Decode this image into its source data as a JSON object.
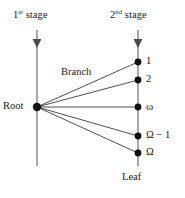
{
  "diagram": {
    "background_color": "#ffffff",
    "axis_color": "#a8a8a8",
    "branch_color": "#3a3a3a",
    "node_color": "#1a1a1a",
    "text_color": "#1a1a1a",
    "stages": [
      {
        "id": "stage-1",
        "ordinal": "1",
        "suffix": "st",
        "word": "stage",
        "x": 37
      },
      {
        "id": "stage-2",
        "ordinal": "2",
        "suffix": "nd",
        "word": "stage",
        "x": 138
      }
    ],
    "labels": {
      "root": "Root",
      "branch": "Branch",
      "leaf": "Leaf"
    },
    "root_node": {
      "x": 37,
      "y": 107
    },
    "leaf_nodes": [
      {
        "label": "1",
        "x": 138,
        "y": 62
      },
      {
        "label": "2",
        "x": 138,
        "y": 80
      },
      {
        "label": "ω",
        "x": 138,
        "y": 107
      },
      {
        "label": "Ω − 1",
        "x": 138,
        "y": 136
      },
      {
        "label": "Ω",
        "x": 138,
        "y": 153
      }
    ],
    "vertical_lines": [
      {
        "id": "stage-1-axis",
        "x": 37,
        "y_top": 30,
        "y_bottom": 166,
        "arrow_y": 45
      },
      {
        "id": "stage-2-axis",
        "x": 138,
        "y_top": 30,
        "y_bottom": 166,
        "arrow_y": 45
      }
    ]
  }
}
